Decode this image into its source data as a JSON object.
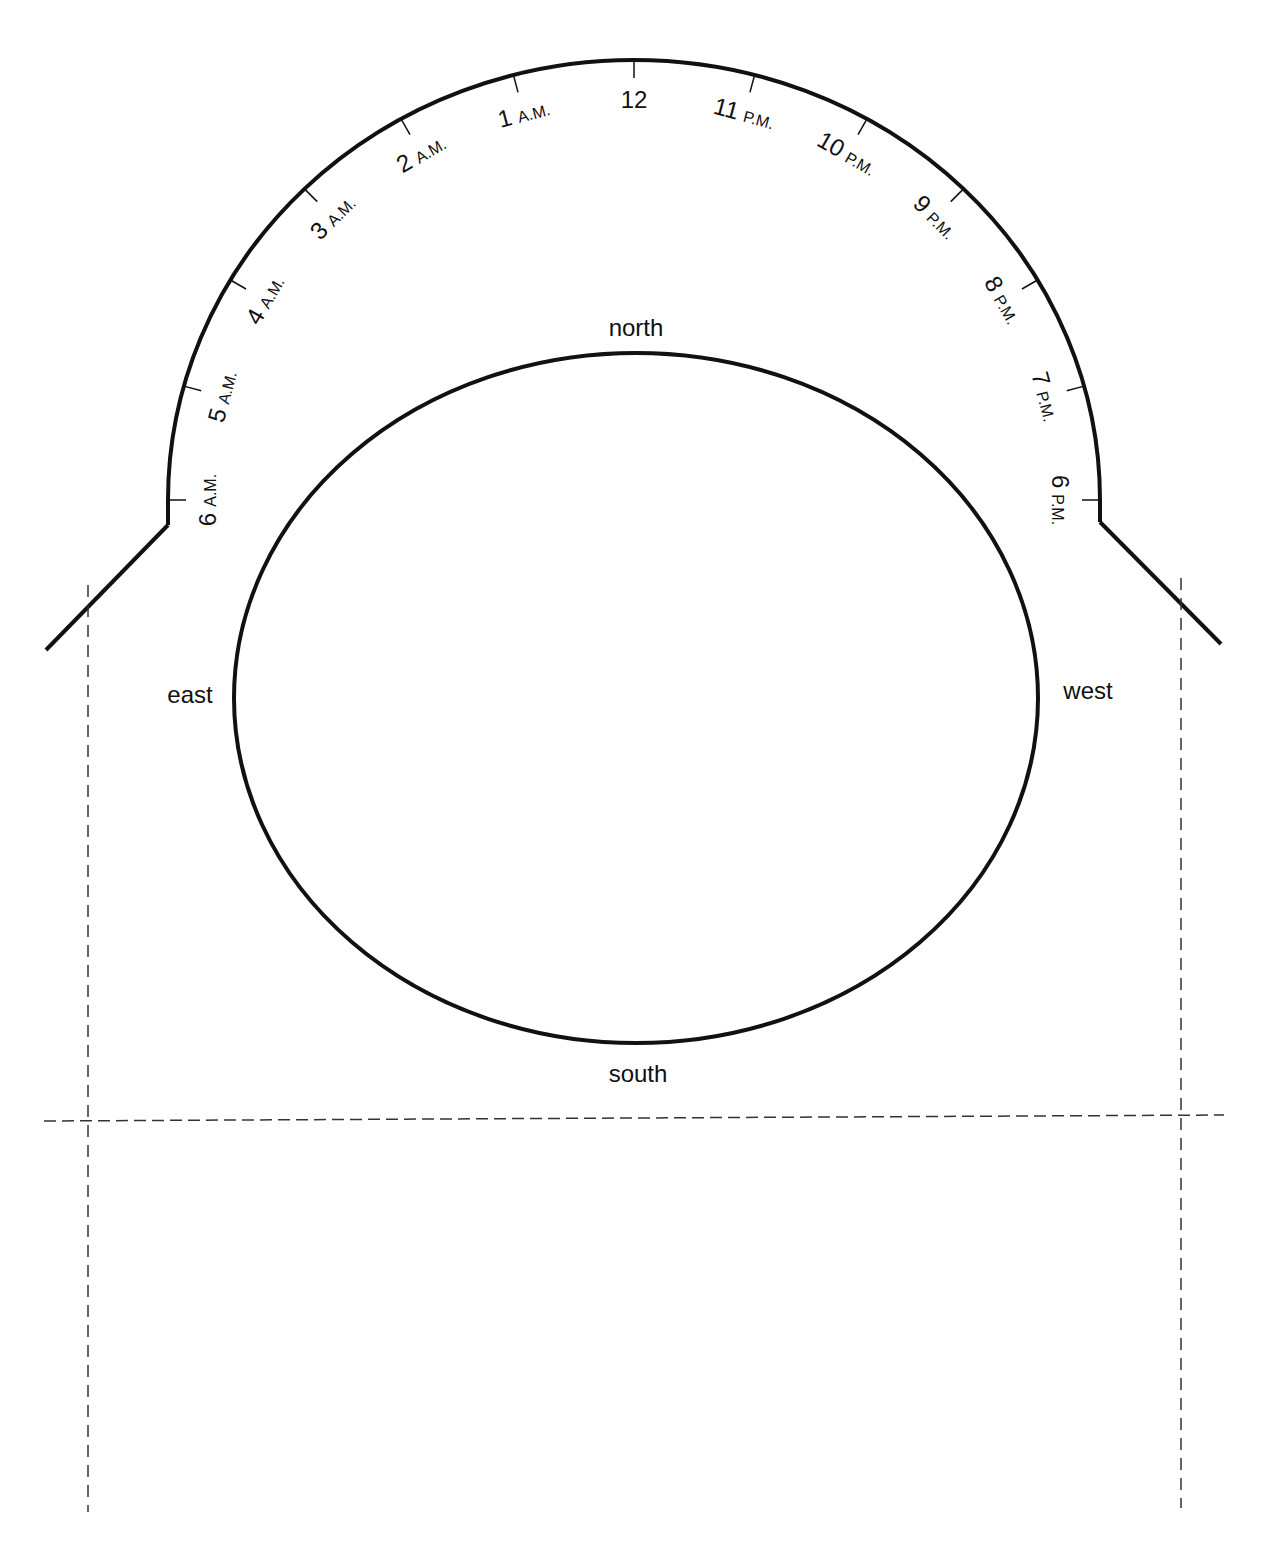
{
  "diagram": {
    "type": "sundial/horizon template",
    "hour_labels": [
      {
        "num": "6",
        "suffix": "A.M."
      },
      {
        "num": "5",
        "suffix": "A.M."
      },
      {
        "num": "4",
        "suffix": "A.M."
      },
      {
        "num": "3",
        "suffix": "A.M."
      },
      {
        "num": "2",
        "suffix": "A.M."
      },
      {
        "num": "1",
        "suffix": "A.M."
      },
      {
        "num": "12",
        "suffix": ""
      },
      {
        "num": "11",
        "suffix": "P.M."
      },
      {
        "num": "10",
        "suffix": "P.M."
      },
      {
        "num": "9",
        "suffix": "P.M."
      },
      {
        "num": "8",
        "suffix": "P.M."
      },
      {
        "num": "7",
        "suffix": "P.M."
      },
      {
        "num": "6",
        "suffix": "P.M."
      }
    ],
    "directions": {
      "north": "north",
      "south": "south",
      "east": "east",
      "west": "west"
    },
    "colors": {
      "stroke": "#111111",
      "dashed": "#333333",
      "background": "#ffffff"
    }
  }
}
